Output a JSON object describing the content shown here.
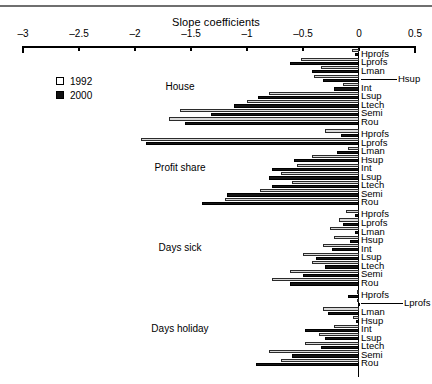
{
  "chart_data": {
    "type": "bar",
    "orientation": "horizontal",
    "title": "Slope coefficients",
    "xlabel": "",
    "ylabel": "",
    "xlim": [
      -3,
      0.5
    ],
    "xticks": [
      -3,
      -2.5,
      -2,
      -1.5,
      -1,
      -0.5,
      0,
      0.5
    ],
    "xtick_labels": [
      "–3",
      "–2.5",
      "–2",
      "–1.5",
      "–1",
      "–0.5",
      "0",
      "0.5"
    ],
    "grid": false,
    "legend": {
      "position": "upper-left",
      "entries": [
        {
          "label": "1992",
          "swatch": "open"
        },
        {
          "label": "2000",
          "swatch": "filled"
        }
      ]
    },
    "series_names": [
      "1992",
      "2000"
    ],
    "categories": [
      "Hprofs",
      "Lprofs",
      "Lman",
      "Hsup",
      "Int",
      "Lsup",
      "Ltech",
      "Semi",
      "Rou"
    ],
    "groups": [
      {
        "name": "House",
        "categories": [
          "Hprofs",
          "Lprofs",
          "Lman",
          "Hsup",
          "Int",
          "Lsup",
          "Ltech",
          "Semi",
          "Rou"
        ],
        "series": [
          {
            "name": "1992",
            "values": [
              -0.06,
              -0.52,
              -0.34,
              -0.4,
              -0.14,
              -0.8,
              -1.0,
              -1.6,
              -1.7
            ]
          },
          {
            "name": "2000",
            "values": [
              -0.04,
              -0.62,
              -0.42,
              -0.32,
              -0.22,
              -0.9,
              -1.12,
              -1.32,
              -1.55
            ]
          }
        ]
      },
      {
        "name": "Profit share",
        "categories": [
          "Hprofs",
          "Lprofs",
          "Lman",
          "Hsup",
          "Int",
          "Lsup",
          "Ltech",
          "Semi",
          "Rou"
        ],
        "series": [
          {
            "name": "1992",
            "values": [
              -0.3,
              -1.95,
              -0.1,
              -0.42,
              -0.55,
              -0.7,
              -0.6,
              -0.88,
              -1.2
            ]
          },
          {
            "name": "2000",
            "values": [
              -0.16,
              -1.9,
              -0.2,
              -0.58,
              -0.78,
              -0.8,
              -0.78,
              -1.18,
              -1.4
            ]
          }
        ]
      },
      {
        "name": "Days sick",
        "categories": [
          "Hprofs",
          "Lprofs",
          "Lman",
          "Hsup",
          "Int",
          "Lsup",
          "Ltech",
          "Semi",
          "Rou"
        ],
        "series": [
          {
            "name": "1992",
            "values": [
              -0.12,
              -0.18,
              -0.26,
              -0.22,
              -0.32,
              -0.5,
              -0.42,
              -0.62,
              -0.78
            ]
          },
          {
            "name": "2000",
            "values": [
              -0.04,
              -0.14,
              -0.04,
              -0.08,
              -0.24,
              -0.38,
              -0.3,
              -0.5,
              -0.62
            ]
          }
        ]
      },
      {
        "name": "Days holiday",
        "categories": [
          "Hprofs",
          "Lprofs",
          "Lman",
          "Hsup",
          "Int",
          "Lsup",
          "Ltech",
          "Semi",
          "Rou"
        ],
        "series": [
          {
            "name": "1992",
            "values": [
              -0.02,
              -0.02,
              -0.32,
              -0.05,
              -0.22,
              -0.36,
              -0.48,
              -0.8,
              -0.7
            ]
          },
          {
            "name": "2000",
            "values": [
              -0.1,
              -0.01,
              -0.28,
              -0.03,
              -0.48,
              -0.3,
              -0.34,
              -0.6,
              -0.92
            ]
          }
        ]
      }
    ]
  },
  "colors": {
    "series_1992": "#d9d9d9",
    "series_2000": "#151515",
    "axis": "#000000",
    "rule": "#6f6f6f",
    "background": "#ffffff"
  }
}
